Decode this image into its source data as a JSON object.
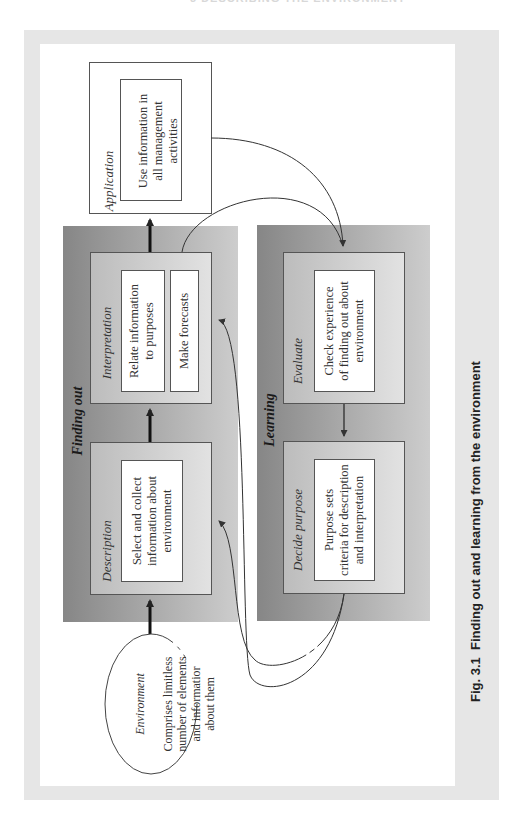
{
  "page_header": "3 DESCRIBING THE ENVIRONMENT",
  "caption": {
    "number": "Fig. 3.1",
    "text": "Finding out and learning from the environment"
  },
  "application": {
    "title": "Application",
    "body": "Use information in\nall management\nactivities"
  },
  "finding_out": {
    "label": "Finding out",
    "interpretation": {
      "title": "Interpretation",
      "box1": "Relate information\nto purposes",
      "box2": "Make forecasts"
    },
    "description": {
      "title": "Description",
      "body": "Select and collect\ninformation about\nenvironment"
    }
  },
  "learning": {
    "label": "Learning",
    "evaluate": {
      "title": "Evaluate",
      "body": "Check experience\nof finding out about\nenvironment"
    },
    "decide_purpose": {
      "title": "Decide purpose",
      "body": "Purpose sets\ncriteria for description\nand interpretation"
    }
  },
  "environment": {
    "title": "Environment",
    "body": "Comprises limitless\nnumber of elements\nand informatior\nabout them"
  },
  "colors": {
    "frame": "#e6e6e6",
    "panel_dark": "#868686",
    "panel_light": "#cdcdcd",
    "stage_dark": "#bcbcbc",
    "stage_light": "#e2e2e2",
    "line": "#444444"
  }
}
